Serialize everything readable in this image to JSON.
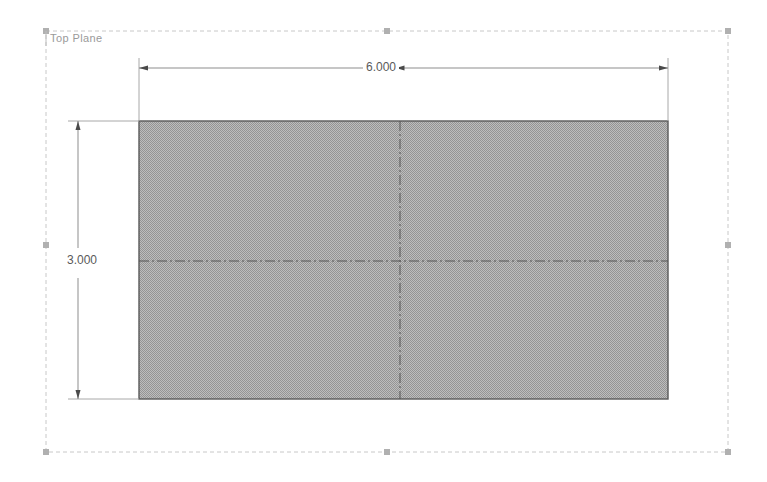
{
  "canvas": {
    "width": 767,
    "height": 482,
    "background": "#ffffff"
  },
  "plane": {
    "label": "Top Plane",
    "color": "#9a9a9a"
  },
  "sketch": {
    "shape": "rectangle",
    "fill_color": "#a9a9a9",
    "edge_color": "#5a5a5a",
    "rect": {
      "x": 139,
      "y": 121,
      "width": 529,
      "height": 278
    },
    "centerline_color": "#555555"
  },
  "dimensions": [
    {
      "name": "width",
      "value": "6.000",
      "orientation": "horizontal",
      "color": "#5a5a5a"
    },
    {
      "name": "height",
      "value": "3.000",
      "orientation": "vertical",
      "color": "#5a5a5a"
    }
  ],
  "selection": {
    "boundary_color": "#c8c8c8",
    "handle_color": "#b0b0b0",
    "bounds": {
      "left": 46,
      "top": 31,
      "right": 728,
      "bottom": 452
    },
    "handles": [
      {
        "name": "handle-top-left",
        "x": 46,
        "y": 31
      },
      {
        "name": "handle-top-center",
        "x": 387,
        "y": 31
      },
      {
        "name": "handle-top-right",
        "x": 728,
        "y": 31
      },
      {
        "name": "handle-middle-left",
        "x": 46,
        "y": 245
      },
      {
        "name": "handle-middle-right",
        "x": 728,
        "y": 245
      },
      {
        "name": "handle-bottom-left",
        "x": 46,
        "y": 452
      },
      {
        "name": "handle-bottom-center",
        "x": 387,
        "y": 452
      },
      {
        "name": "handle-bottom-right",
        "x": 728,
        "y": 452
      }
    ]
  }
}
